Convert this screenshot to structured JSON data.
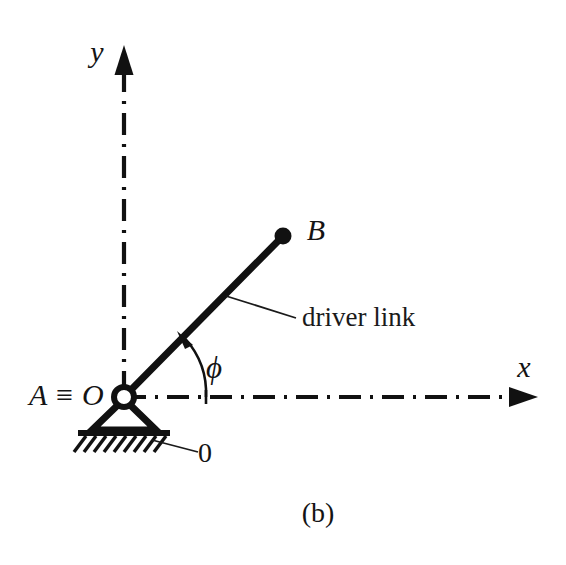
{
  "figure": {
    "caption": "(b)",
    "background_color": "#ffffff",
    "ink_color": "#111111"
  },
  "axes": {
    "x_label": "x",
    "y_label": "y",
    "line_style": "dash-dot",
    "origin_px": {
      "x": 124,
      "y": 397
    },
    "x_arrow_tip_px": {
      "x": 538,
      "y": 397
    },
    "y_arrow_tip_px": {
      "x": 124,
      "y": 45
    }
  },
  "joints": {
    "ground_pivot_label": "A ≡ O",
    "ground_pivot_name_a": "A",
    "ground_pivot_identity": "≡",
    "ground_pivot_name_o": "O",
    "moving_point_label": "B",
    "ground_link_label": "0"
  },
  "link": {
    "label": "driver link",
    "start_px": {
      "x": 124,
      "y": 397
    },
    "end_px": {
      "x": 283,
      "y": 236
    },
    "angle_deg": 45,
    "stroke_width": 7
  },
  "angle": {
    "symbol": "ϕ",
    "from": "x-axis",
    "to": "driver link",
    "direction": "counterclockwise",
    "arc_radius_px": 82
  }
}
